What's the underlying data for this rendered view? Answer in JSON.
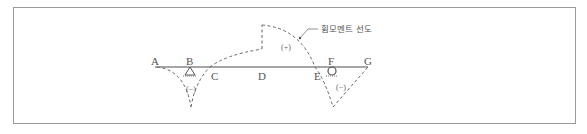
{
  "figure": {
    "annotation_label": "휨모멘트 선도",
    "points": {
      "A": "A",
      "B": "B",
      "C": "C",
      "D": "D",
      "E": "E",
      "F": "F",
      "G": "G"
    },
    "signs": {
      "positive": "(+)",
      "negative_left": "(−)",
      "negative_right": "(−)"
    },
    "supports": {
      "B": "pin-support",
      "F": "roller-support"
    },
    "colors": {
      "beam": "#888888",
      "diagram_line": "#666666",
      "frame": "#9a9a9a"
    }
  }
}
